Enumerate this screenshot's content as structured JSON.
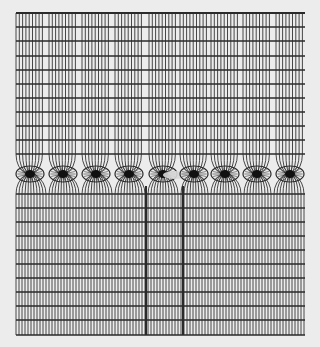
{
  "figure": {
    "background": "#ececec",
    "line_color": "#2a2a2a",
    "grid": {
      "left": 16,
      "right": 305,
      "top": 13,
      "bottom": 335,
      "top_horizontal_lines_y": [
        13,
        27,
        41,
        56,
        70,
        84,
        98,
        112,
        126,
        140,
        154
      ],
      "bottom_horizontal_lines_y": [
        194,
        208,
        222,
        236,
        250,
        264,
        278,
        292,
        306,
        320,
        335
      ],
      "top_vertical_spacing": 3.3,
      "bottom_vertical_spacing": 3.0,
      "thick_vertical_lines_x": [
        146,
        183
      ]
    },
    "cores": {
      "y": 174,
      "rx": 14,
      "ry": 8,
      "centers_x": [
        30,
        63,
        96,
        129,
        163,
        194,
        225,
        257,
        290
      ],
      "defect_index": 4
    }
  }
}
